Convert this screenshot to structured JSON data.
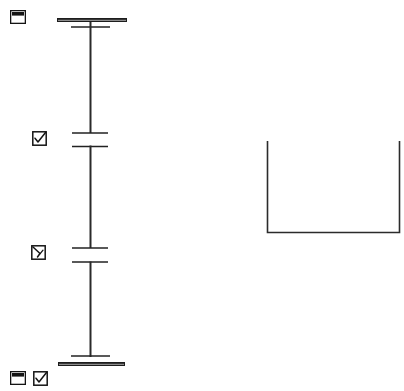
{
  "canvas": {
    "width": 404,
    "height": 391,
    "background": "#ffffff",
    "ink": "#1a1a1a",
    "ink_soft": "#3a3a3a",
    "title": "Scanned engineering elevation detail"
  },
  "icons": [
    {
      "name": "window-icon-top-left",
      "glyph": "window",
      "label": "Window marker",
      "x": 10,
      "y": 10,
      "w": 16,
      "h": 14,
      "checked": false
    },
    {
      "name": "checkbox-checked-upper",
      "glyph": "checkbox-checked",
      "label": "Checked box marker",
      "x": 32,
      "y": 131,
      "w": 15,
      "h": 15,
      "checked": true
    },
    {
      "name": "checkbox-checked-lower",
      "glyph": "checkbox-checked",
      "label": "Checked box marker",
      "x": 31,
      "y": 245,
      "w": 15,
      "h": 15,
      "checked": true
    },
    {
      "name": "window-icon-bottom-left",
      "glyph": "window",
      "label": "Window marker",
      "x": 10,
      "y": 371,
      "w": 16,
      "h": 14,
      "checked": false
    },
    {
      "name": "checkbox-checked-bottom",
      "glyph": "checkbox-checked",
      "label": "Checked box marker",
      "x": 33,
      "y": 371,
      "w": 15,
      "h": 15,
      "checked": true
    }
  ],
  "column": {
    "name": "column-elevation",
    "shaft_x": 90,
    "shaft_top": 27,
    "shaft_bottom": 356,
    "shaft_width": 2,
    "top_cap": {
      "x1": 57,
      "x2": 127,
      "y": 20,
      "thickness": 4,
      "label": "Top plate"
    },
    "top_flange": {
      "x1": 71,
      "x2": 110,
      "y": 27,
      "thickness": 1.4,
      "label": "Upper flange"
    },
    "base_cap": {
      "x1": 58,
      "x2": 125,
      "y": 364,
      "thickness": 4,
      "label": "Base plate"
    },
    "base_flange": {
      "x1": 71,
      "x2": 110,
      "y": 356,
      "thickness": 1.4,
      "label": "Lower flange"
    },
    "joints": [
      {
        "name": "joint-upper",
        "upper_bar": {
          "x1": 72,
          "x2": 108,
          "y": 133
        },
        "lower_bar": {
          "x1": 72,
          "x2": 108,
          "y": 146
        },
        "gap_top": 133,
        "gap_bottom": 146
      },
      {
        "name": "joint-lower",
        "upper_bar": {
          "x1": 72,
          "x2": 108,
          "y": 248
        },
        "lower_bar": {
          "x1": 72,
          "x2": 108,
          "y": 262
        },
        "gap_top": 248,
        "gap_bottom": 262
      }
    ]
  },
  "bracket": {
    "name": "u-bracket-detail",
    "label": "U-shaped channel section",
    "left_x": 267,
    "right_x": 399,
    "top_y": 141,
    "bottom_y": 233,
    "stroke": 1.6
  }
}
